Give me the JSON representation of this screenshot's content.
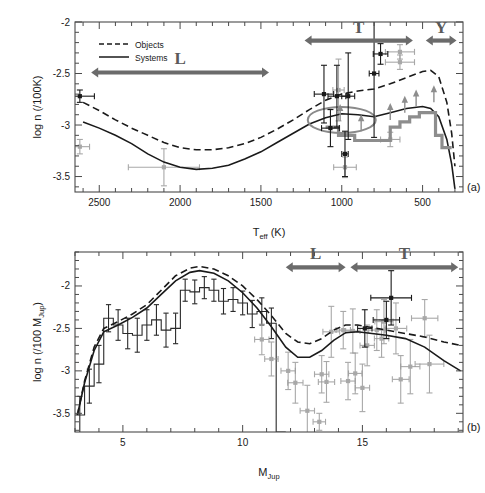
{
  "figure": {
    "panels": [
      {
        "tag": "(a)",
        "xlabel_main": "T",
        "xlabel_sub": "eff",
        "xlabel_unit": " (K)",
        "ylabel": "log n (/100K)",
        "xticks": [
          2500,
          2000,
          1500,
          1000,
          500
        ],
        "yticks": [
          -2,
          -2.5,
          -3,
          -3.5
        ],
        "xlim": [
          2650,
          250
        ],
        "ylim": [
          -3.65,
          -2.0
        ],
        "legend": [
          {
            "label": "Objects",
            "style": "dashed"
          },
          {
            "label": "Systems",
            "style": "solid"
          }
        ],
        "bands": [
          {
            "label": "L",
            "x0": 2550,
            "x1": 1450,
            "y": -2.49
          },
          {
            "label": "T",
            "x0": 1230,
            "x1": 560,
            "y": -2.18
          },
          {
            "label": "Y",
            "x0": 480,
            "x1": 290,
            "y": -2.18
          }
        ]
      },
      {
        "tag": "(b)",
        "xlabel_main": "M",
        "xlabel_sub": "Jup",
        "xlabel_unit": "",
        "ylabel": "log n (/100 M",
        "ylabel_sub": "Jup",
        "ylabel_tail": ")",
        "xticks": [
          5,
          10,
          15
        ],
        "yticks": [
          -2,
          -2.5,
          -3,
          -3.5
        ],
        "xlim": [
          3.0,
          19.2
        ],
        "ylim": [
          -3.72,
          -1.6
        ],
        "bands": [
          {
            "label": "L",
            "x0": 11.8,
            "x1": 14.3,
            "y": -1.78
          },
          {
            "label": "T",
            "x0": 14.5,
            "x1": 19.0,
            "y": -1.78
          }
        ]
      }
    ]
  },
  "chart_data": [
    {
      "type": "line",
      "panel": "(a)",
      "title": "",
      "xlabel": "T_eff (K)",
      "ylabel": "log n (/100K)",
      "xlim": [
        2650,
        250
      ],
      "ylim": [
        -3.65,
        -2.0
      ],
      "xticks": [
        2500,
        2000,
        1500,
        1000,
        500
      ],
      "yticks": [
        -2,
        -2.5,
        -3,
        -3.5
      ],
      "x_reversed": true,
      "grid": false,
      "legend_position": "upper-left",
      "series": [
        {
          "name": "Objects",
          "style": "dashed",
          "color": "#1a1a1a",
          "x": [
            2600,
            2500,
            2400,
            2300,
            2200,
            2100,
            2000,
            1900,
            1800,
            1700,
            1600,
            1500,
            1400,
            1300,
            1200,
            1100,
            1000,
            900,
            800,
            700,
            600,
            500,
            450,
            400,
            350,
            320,
            300
          ],
          "y": [
            -2.78,
            -2.86,
            -2.95,
            -3.03,
            -3.1,
            -3.17,
            -3.22,
            -3.24,
            -3.24,
            -3.22,
            -3.18,
            -3.12,
            -3.04,
            -2.95,
            -2.85,
            -2.76,
            -2.7,
            -2.67,
            -2.65,
            -2.6,
            -2.54,
            -2.48,
            -2.47,
            -2.53,
            -2.78,
            -3.08,
            -3.4
          ]
        },
        {
          "name": "Systems",
          "style": "solid",
          "color": "#1a1a1a",
          "x": [
            2600,
            2500,
            2400,
            2300,
            2200,
            2100,
            2000,
            1900,
            1800,
            1700,
            1600,
            1500,
            1400,
            1300,
            1200,
            1100,
            1000,
            900,
            800,
            700,
            600,
            500,
            450,
            400,
            350,
            320,
            300
          ],
          "y": [
            -2.97,
            -3.03,
            -3.1,
            -3.18,
            -3.28,
            -3.36,
            -3.41,
            -3.43,
            -3.42,
            -3.39,
            -3.33,
            -3.26,
            -3.17,
            -3.08,
            -2.99,
            -2.93,
            -2.89,
            -2.9,
            -2.92,
            -2.88,
            -2.84,
            -2.82,
            -2.84,
            -2.92,
            -3.14,
            -3.38,
            -3.62
          ]
        },
        {
          "name": "gray-step",
          "style": "step",
          "color": "#8d8d8d",
          "x": [
            1100,
            1020,
            1020,
            920,
            920,
            820,
            820,
            700,
            700,
            640,
            640,
            580,
            580,
            520,
            520,
            470,
            470,
            420,
            420,
            380,
            380,
            320
          ],
          "y": [
            -3.02,
            -3.02,
            -3.1,
            -3.1,
            -3.15,
            -3.15,
            -3.15,
            -3.15,
            -3.02,
            -3.02,
            -2.97,
            -2.97,
            -2.92,
            -2.92,
            -2.88,
            -2.88,
            -2.88,
            -2.88,
            -3.1,
            -3.1,
            -3.22,
            -3.22
          ]
        }
      ],
      "points_black": [
        {
          "x": 1110,
          "y": -2.7,
          "xerr": 60,
          "yerr": 0.28
        },
        {
          "x": 1030,
          "y": -2.72,
          "xerr": 55,
          "yerr": 0.3
        },
        {
          "x": 1070,
          "y": -3.03,
          "xerr": 55,
          "yerr": 0.18
        },
        {
          "x": 960,
          "y": -2.72,
          "xerr": 40,
          "yerr": 0.42
        },
        {
          "x": 980,
          "y": -3.28,
          "xerr": 20,
          "yerr": 0.22
        },
        {
          "x": 800,
          "y": -2.5,
          "xerr": 30,
          "yerr": 0.62
        },
        {
          "x": 760,
          "y": -2.31,
          "xerr": 45,
          "yerr": 0.1
        },
        {
          "x": 2620,
          "y": -2.72,
          "xerr": 90,
          "yerr": 0.06
        }
      ],
      "points_gray": [
        {
          "x": 2620,
          "y": -3.21,
          "xerr": 60,
          "yerr": 0.07
        },
        {
          "x": 2100,
          "y": -3.41,
          "xerr": 220,
          "yerr": 0.18
        },
        {
          "x": 1020,
          "y": -2.66,
          "xerr": 35,
          "yerr": 0.3
        },
        {
          "x": 980,
          "y": -3.41,
          "xerr": 70,
          "yerr": 0.1
        },
        {
          "x": 640,
          "y": -2.29,
          "xerr": 90,
          "yerr": 0.07
        },
        {
          "x": 640,
          "y": -2.39,
          "xerr": 90,
          "yerr": 0.07
        },
        {
          "x": 700,
          "y": -3.14,
          "xerr": 60,
          "yerr": 0.07
        }
      ]
    },
    {
      "type": "line",
      "panel": "(b)",
      "title": "",
      "xlabel": "M_Jup",
      "ylabel": "log n (/100 M_Jup)",
      "xlim": [
        3.0,
        19.2
      ],
      "ylim": [
        -3.72,
        -1.6
      ],
      "xticks": [
        5,
        10,
        15
      ],
      "yticks": [
        -2,
        -2.5,
        -3,
        -3.5
      ],
      "grid": false,
      "series": [
        {
          "name": "Objects",
          "style": "dashed",
          "color": "#1a1a1a",
          "x": [
            3.1,
            3.4,
            3.8,
            4.2,
            4.8,
            5.4,
            6.0,
            6.6,
            7.2,
            7.8,
            8.2,
            8.8,
            9.4,
            10.0,
            10.6,
            11.2,
            11.8,
            12.3,
            12.8,
            13.3,
            13.8,
            14.3,
            14.8,
            15.4,
            16.0,
            16.8,
            17.6,
            18.4,
            19.1
          ],
          "y": [
            -3.52,
            -3.12,
            -2.72,
            -2.5,
            -2.42,
            -2.33,
            -2.22,
            -2.05,
            -1.88,
            -1.79,
            -1.77,
            -1.8,
            -1.88,
            -2.0,
            -2.16,
            -2.35,
            -2.56,
            -2.66,
            -2.68,
            -2.62,
            -2.52,
            -2.46,
            -2.46,
            -2.49,
            -2.52,
            -2.56,
            -2.6,
            -2.66,
            -2.7
          ]
        },
        {
          "name": "Systems",
          "style": "solid",
          "color": "#1a1a1a",
          "x": [
            3.1,
            3.4,
            3.8,
            4.2,
            4.8,
            5.4,
            6.0,
            6.6,
            7.2,
            7.8,
            8.2,
            8.8,
            9.4,
            10.0,
            10.6,
            11.2,
            11.8,
            12.3,
            12.8,
            13.3,
            13.8,
            14.3,
            14.8,
            15.4,
            16.0,
            16.8,
            17.6,
            18.4,
            19.1
          ],
          "y": [
            -3.52,
            -3.14,
            -2.76,
            -2.54,
            -2.46,
            -2.37,
            -2.26,
            -2.1,
            -1.94,
            -1.84,
            -1.82,
            -1.85,
            -1.94,
            -2.08,
            -2.26,
            -2.48,
            -2.72,
            -2.84,
            -2.84,
            -2.76,
            -2.64,
            -2.55,
            -2.54,
            -2.56,
            -2.58,
            -2.62,
            -2.72,
            -2.88,
            -3.0
          ]
        }
      ],
      "histogram": {
        "name": "Systems histogram",
        "color": "#2a2a2a",
        "bin_edges": [
          3.0,
          3.4,
          3.8,
          4.2,
          4.6,
          5.0,
          5.4,
          5.8,
          6.2,
          6.6,
          7.0,
          7.4,
          7.8,
          8.2,
          8.6,
          9.0,
          9.4,
          9.8,
          10.2,
          10.6,
          11.0,
          11.4,
          11.8
        ],
        "values": [
          -3.52,
          -3.18,
          -2.92,
          -2.38,
          -2.46,
          -2.56,
          -2.58,
          -2.46,
          -2.4,
          -2.52,
          -2.5,
          -2.05,
          -2.07,
          -2.02,
          -2.05,
          -2.18,
          -2.16,
          -2.2,
          -2.33,
          -2.3,
          -2.44,
          -3.72
        ],
        "errors": [
          0.22,
          0.2,
          0.22,
          0.16,
          0.18,
          0.18,
          0.2,
          0.18,
          0.18,
          0.2,
          0.18,
          0.13,
          0.14,
          0.13,
          0.13,
          0.15,
          0.14,
          0.14,
          0.16,
          0.16,
          0.18,
          0.0
        ]
      },
      "points_black": [
        {
          "x": 16.2,
          "y": -2.14,
          "xerr": 0.85,
          "yerr": 0.32
        },
        {
          "x": 15.1,
          "y": -2.5,
          "xerr": 0.3,
          "yerr": 0.22
        },
        {
          "x": 16.0,
          "y": -2.4,
          "xerr": 0.55,
          "yerr": 0.22
        }
      ],
      "points_gray": [
        {
          "x": 10.8,
          "y": -2.63,
          "xerr": 0.3,
          "yerr": 0.18
        },
        {
          "x": 11.2,
          "y": -2.86,
          "xerr": 0.28,
          "yerr": 0.2
        },
        {
          "x": 11.9,
          "y": -3.0,
          "xerr": 0.3,
          "yerr": 0.22
        },
        {
          "x": 12.2,
          "y": -3.14,
          "xerr": 0.32,
          "yerr": 0.24
        },
        {
          "x": 12.7,
          "y": -3.47,
          "xerr": 0.3,
          "yerr": 0.3
        },
        {
          "x": 13.2,
          "y": -3.6,
          "xerr": 0.26,
          "yerr": 0.1
        },
        {
          "x": 13.3,
          "y": -3.04,
          "xerr": 0.3,
          "yerr": 0.22
        },
        {
          "x": 13.5,
          "y": -3.13,
          "xerr": 0.34,
          "yerr": 0.24
        },
        {
          "x": 13.7,
          "y": -2.54,
          "xerr": 0.35,
          "yerr": 0.3
        },
        {
          "x": 14.2,
          "y": -2.52,
          "xerr": 0.3,
          "yerr": 0.22
        },
        {
          "x": 14.6,
          "y": -2.53,
          "xerr": 0.3,
          "yerr": 0.26
        },
        {
          "x": 14.4,
          "y": -3.12,
          "xerr": 0.3,
          "yerr": 0.22
        },
        {
          "x": 14.7,
          "y": -3.03,
          "xerr": 0.28,
          "yerr": 0.24
        },
        {
          "x": 15.2,
          "y": -2.7,
          "xerr": 0.3,
          "yerr": 0.24
        },
        {
          "x": 15.6,
          "y": -2.52,
          "xerr": 0.34,
          "yerr": 0.24
        },
        {
          "x": 15.8,
          "y": -2.62,
          "xerr": 0.3,
          "yerr": 0.22
        },
        {
          "x": 15.9,
          "y": -2.42,
          "xerr": 0.38,
          "yerr": 0.26
        },
        {
          "x": 16.4,
          "y": -2.5,
          "xerr": 0.45,
          "yerr": 0.3
        },
        {
          "x": 17.0,
          "y": -2.95,
          "xerr": 0.4,
          "yerr": 0.32
        },
        {
          "x": 17.6,
          "y": -2.38,
          "xerr": 0.55,
          "yerr": 0.22
        },
        {
          "x": 17.8,
          "y": -2.92,
          "xerr": 0.6,
          "yerr": 0.34
        },
        {
          "x": 15.0,
          "y": -3.2,
          "xerr": 0.3,
          "yerr": 0.28
        },
        {
          "x": 16.6,
          "y": -3.1,
          "xerr": 0.35,
          "yerr": 0.28
        }
      ]
    }
  ]
}
